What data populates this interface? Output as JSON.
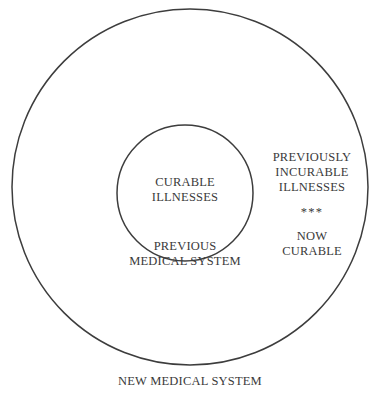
{
  "diagram": {
    "type": "nested-circles-euler",
    "background_color": "#ffffff",
    "stroke_color": "#3d3d3d",
    "text_color": "#3a3a3a",
    "outer_circle": {
      "name": "new-medical-system",
      "center_x": 190,
      "center_y": 187,
      "radius": 178
    },
    "inner_circle": {
      "name": "previous-medical-system",
      "center_x": 185,
      "center_y": 193,
      "radius": 68
    },
    "labels": {
      "inner_content_line1": "CURABLE",
      "inner_content_line2": "ILLNESSES",
      "inner_caption_line1": "PREVIOUS",
      "inner_caption_line2": "MEDICAL SYSTEM",
      "annulus_upper_line1": "PREVIOUSLY",
      "annulus_upper_line2": "INCURABLE",
      "annulus_upper_line3": "ILLNESSES",
      "annulus_separator": "***",
      "annulus_lower_line1": "NOW",
      "annulus_lower_line2": "CURABLE",
      "outer_caption": "NEW MEDICAL SYSTEM"
    }
  }
}
